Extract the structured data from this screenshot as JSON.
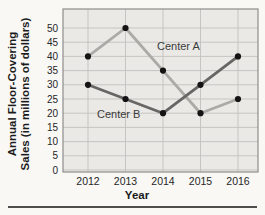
{
  "chart_data": {
    "type": "line",
    "title": "",
    "xlabel": "Year",
    "ylabel": "Annual Floor-Covering Sales (in millions of dollars)",
    "ylabel_lines": [
      "Annual Floor-Covering",
      "Sales (in millions of dollars)"
    ],
    "categories": [
      "2012",
      "2013",
      "2014",
      "2015",
      "2016"
    ],
    "y_ticks": [
      0,
      5,
      10,
      15,
      20,
      25,
      30,
      35,
      40,
      45,
      50
    ],
    "ylim": [
      0,
      50
    ],
    "grid": true,
    "legend_position": "inline-annotations",
    "series": [
      {
        "name": "Center A",
        "values": [
          40,
          50,
          35,
          20,
          25
        ],
        "color": "#abaaa7"
      },
      {
        "name": "Center B",
        "values": [
          30,
          25,
          20,
          30,
          40
        ],
        "color": "#676664"
      }
    ],
    "marker_color": "#141414",
    "colors": {
      "page_background": "#f9f8f5",
      "plot_background": "#eae9e6",
      "grid": "#c2c1be",
      "border": "#8f8e8b",
      "tick_text": "#262626",
      "divider": "#4f4e4c"
    }
  }
}
